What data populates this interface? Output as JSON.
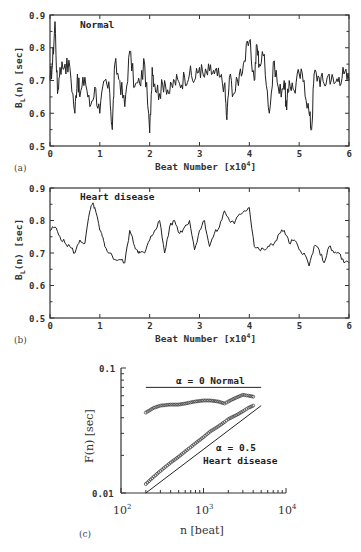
{
  "chart_data": [
    {
      "panel": "(a)",
      "type": "line",
      "title": "Normal",
      "xlabel": "Beat Number [x10^4]",
      "ylabel": "B_L(n) [sec]",
      "xlim": [
        0,
        6
      ],
      "ylim": [
        0.5,
        0.9
      ],
      "xticks": [
        "0",
        "1",
        "2",
        "3",
        "4",
        "5",
        "6"
      ],
      "yticks": [
        "0.5",
        "0.6",
        "0.7",
        "0.8",
        "0.9"
      ],
      "grid": false,
      "series": [
        {
          "name": "Normal",
          "x": [
            0,
            0.05,
            0.1,
            0.15,
            0.2,
            0.3,
            0.4,
            0.5,
            0.55,
            0.6,
            0.7,
            0.8,
            0.9,
            1.0,
            1.1,
            1.2,
            1.25,
            1.3,
            1.4,
            1.5,
            1.6,
            1.7,
            1.8,
            1.9,
            2.0,
            2.05,
            2.1,
            2.2,
            2.3,
            2.4,
            2.5,
            2.6,
            2.7,
            2.8,
            2.9,
            3.0,
            3.1,
            3.2,
            3.3,
            3.4,
            3.5,
            3.55,
            3.6,
            3.7,
            3.8,
            3.9,
            4.0,
            4.1,
            4.15,
            4.2,
            4.3,
            4.4,
            4.5,
            4.6,
            4.7,
            4.75,
            4.8,
            4.9,
            5.0,
            5.1,
            5.2,
            5.25,
            5.3,
            5.4,
            5.5,
            5.6,
            5.7,
            5.8,
            5.9,
            6.0
          ],
          "values": [
            0.7,
            0.75,
            0.88,
            0.66,
            0.74,
            0.75,
            0.74,
            0.6,
            0.72,
            0.65,
            0.71,
            0.62,
            0.68,
            0.6,
            0.7,
            0.66,
            0.55,
            0.75,
            0.7,
            0.62,
            0.79,
            0.68,
            0.69,
            0.75,
            0.54,
            0.74,
            0.69,
            0.66,
            0.7,
            0.66,
            0.7,
            0.69,
            0.71,
            0.72,
            0.7,
            0.74,
            0.71,
            0.73,
            0.72,
            0.71,
            0.69,
            0.58,
            0.71,
            0.66,
            0.72,
            0.76,
            0.82,
            0.7,
            0.81,
            0.75,
            0.78,
            0.6,
            0.76,
            0.66,
            0.7,
            0.61,
            0.7,
            0.67,
            0.72,
            0.7,
            0.6,
            0.55,
            0.72,
            0.71,
            0.69,
            0.72,
            0.69,
            0.71,
            0.72,
            0.7
          ]
        }
      ]
    },
    {
      "panel": "(b)",
      "type": "line",
      "title": "Heart disease",
      "xlabel": "Beat Number [x10^4]",
      "ylabel": "B_L(n) [sec]",
      "xlim": [
        0,
        6
      ],
      "ylim": [
        0.5,
        0.9
      ],
      "xticks": [
        "0",
        "1",
        "2",
        "3",
        "4",
        "5",
        "6"
      ],
      "yticks": [
        "0.5",
        "0.6",
        "0.7",
        "0.8",
        "0.9"
      ],
      "grid": false,
      "series": [
        {
          "name": "Heart disease",
          "x": [
            0,
            0.1,
            0.2,
            0.3,
            0.4,
            0.5,
            0.6,
            0.7,
            0.8,
            0.85,
            0.9,
            1.0,
            1.05,
            1.1,
            1.2,
            1.3,
            1.4,
            1.5,
            1.6,
            1.7,
            1.75,
            1.8,
            1.9,
            2.0,
            2.1,
            2.2,
            2.3,
            2.4,
            2.5,
            2.6,
            2.7,
            2.8,
            2.9,
            3.0,
            3.1,
            3.2,
            3.3,
            3.4,
            3.5,
            3.6,
            3.7,
            3.8,
            3.9,
            4.0,
            4.1,
            4.2,
            4.3,
            4.4,
            4.5,
            4.6,
            4.7,
            4.8,
            4.9,
            5.0,
            5.1,
            5.2,
            5.3,
            5.4,
            5.5,
            5.6,
            5.7,
            5.8,
            5.9,
            6.0
          ],
          "values": [
            0.77,
            0.78,
            0.75,
            0.73,
            0.72,
            0.7,
            0.74,
            0.73,
            0.83,
            0.85,
            0.84,
            0.77,
            0.75,
            0.72,
            0.7,
            0.68,
            0.68,
            0.67,
            0.77,
            0.72,
            0.71,
            0.7,
            0.7,
            0.74,
            0.77,
            0.8,
            0.7,
            0.78,
            0.8,
            0.76,
            0.78,
            0.8,
            0.71,
            0.77,
            0.8,
            0.72,
            0.76,
            0.78,
            0.83,
            0.8,
            0.79,
            0.82,
            0.83,
            0.84,
            0.72,
            0.71,
            0.71,
            0.72,
            0.73,
            0.76,
            0.77,
            0.73,
            0.74,
            0.71,
            0.7,
            0.66,
            0.72,
            0.71,
            0.67,
            0.72,
            0.7,
            0.7,
            0.67,
            0.67
          ]
        }
      ]
    },
    {
      "panel": "(c)",
      "type": "scatter",
      "title": "",
      "xlabel": "n [beat]",
      "ylabel": "F(n) [sec]",
      "xscale": "log",
      "yscale": "log",
      "xlim": [
        100,
        10000
      ],
      "ylim": [
        0.01,
        0.1
      ],
      "xticks": [
        "10^2",
        "10^3",
        "10^4"
      ],
      "yticks": [
        "0.01",
        "0.1"
      ],
      "grid": false,
      "series": [
        {
          "name": "Normal",
          "x": [
            200,
            250,
            300,
            400,
            500,
            600,
            800,
            1000,
            1200,
            1500,
            1800,
            2000,
            2500,
            3000,
            3500,
            4000
          ],
          "values": [
            0.044,
            0.048,
            0.05,
            0.051,
            0.051,
            0.052,
            0.054,
            0.055,
            0.055,
            0.054,
            0.052,
            0.054,
            0.058,
            0.061,
            0.06,
            0.059
          ]
        },
        {
          "name": "Heart disease",
          "x": [
            200,
            250,
            300,
            400,
            500,
            600,
            800,
            1000,
            1200,
            1500,
            1800,
            2000,
            2500,
            3000,
            3500,
            4000
          ],
          "values": [
            0.0118,
            0.0135,
            0.015,
            0.0175,
            0.0195,
            0.0215,
            0.025,
            0.028,
            0.031,
            0.034,
            0.037,
            0.039,
            0.042,
            0.045,
            0.048,
            0.05
          ]
        }
      ],
      "reference_lines": [
        {
          "label": "α = 0  Normal",
          "slope": 0,
          "x": [
            200,
            5000
          ],
          "values": [
            0.07,
            0.07
          ]
        },
        {
          "label": "α = 0.5  Heart disease",
          "slope": 0.5,
          "x": [
            200,
            5000
          ],
          "values": [
            0.01,
            0.05
          ]
        }
      ]
    }
  ],
  "panels": {
    "a": {
      "label": "(a)",
      "title": "Normal",
      "xlabel": "Beat Number [x10",
      "xlabel_exp": "4",
      "xlabel_end": "]",
      "ylabel": "B",
      "ylabel_sub": "L",
      "ylabel_rest": "(n) [sec]",
      "xticks": [
        "0",
        "1",
        "2",
        "3",
        "4",
        "5",
        "6"
      ],
      "yticks": [
        "0.5",
        "0.6",
        "0.7",
        "0.8",
        "0.9"
      ]
    },
    "b": {
      "label": "(b)",
      "title": "Heart disease",
      "xlabel": "Beat Number [x10",
      "xlabel_exp": "4",
      "xlabel_end": "]",
      "ylabel": "B",
      "ylabel_sub": "L",
      "ylabel_rest": "(n) [sec]",
      "xticks": [
        "0",
        "1",
        "2",
        "3",
        "4",
        "5",
        "6"
      ],
      "yticks": [
        "0.5",
        "0.6",
        "0.7",
        "0.8",
        "0.9"
      ]
    },
    "c": {
      "label": "(c)",
      "xlabel": "n [beat]",
      "ylabel": "F(n) [sec]",
      "xtick_base": "10",
      "xtick_exps": [
        "2",
        "3",
        "4"
      ],
      "yticks": [
        "0.1",
        "0.01"
      ],
      "annot_normal": "α = 0  Normal",
      "annot_alpha_hd": "α = 0.5",
      "annot_hd": "Heart disease"
    }
  }
}
